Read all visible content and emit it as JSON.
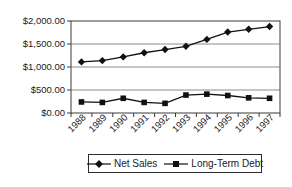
{
  "chart_data": {
    "type": "line",
    "title": "",
    "xlabel": "",
    "ylabel": "",
    "categories": [
      "1988",
      "1989",
      "1990",
      "1991",
      "1992",
      "1993",
      "1994",
      "1995",
      "1996",
      "1997"
    ],
    "series": [
      {
        "name": "Net Sales",
        "marker": "diamond",
        "values": [
          1110,
          1140,
          1220,
          1310,
          1380,
          1450,
          1600,
          1760,
          1820,
          1880
        ]
      },
      {
        "name": "Long-Term Debt",
        "marker": "square",
        "values": [
          240,
          230,
          320,
          230,
          210,
          390,
          410,
          380,
          330,
          320
        ]
      }
    ],
    "y_axis": {
      "min": 0,
      "max": 2000,
      "step": 500,
      "tick_labels": [
        "$0.00",
        "$500.00",
        "$1,000.00",
        "$1,500.00",
        "$2,000.00"
      ]
    },
    "x_axis": {
      "label_rotation": -45
    },
    "grid": true,
    "legend_position": "bottom",
    "colors": {
      "series": "#111111",
      "grid": "#6e6e6e",
      "axis": "#3a3a3a",
      "text": "#1a1a1a",
      "background": "#ffffff"
    }
  }
}
